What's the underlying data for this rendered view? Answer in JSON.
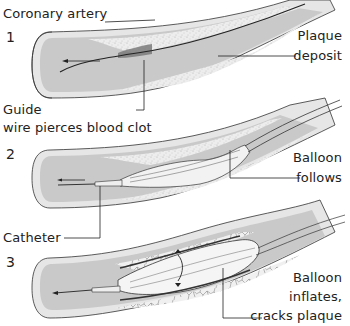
{
  "diagram": {
    "colors": {
      "background": "#ffffff",
      "artery_wall": "#e6e6e6",
      "artery_lumen": "#c9c9c9",
      "plaque": "#ececec",
      "plaque_speckle": "#a8a8a8",
      "clot": "#7a7a7a",
      "balloon": "#f4f4f4",
      "line": "#222222"
    },
    "stages": [
      {
        "number": "1",
        "labels": {
          "left_top": "Coronary artery",
          "right": [
            "Plaque",
            "deposit"
          ],
          "left_bottom": [
            "Guide",
            "wire pierces blood clot"
          ]
        }
      },
      {
        "number": "2",
        "labels": {
          "right": [
            "Balloon",
            "follows"
          ],
          "left_bottom": "Catheter"
        }
      },
      {
        "number": "3",
        "labels": {
          "right": [
            "Balloon",
            "inflates,",
            "cracks plaque"
          ]
        }
      }
    ]
  }
}
